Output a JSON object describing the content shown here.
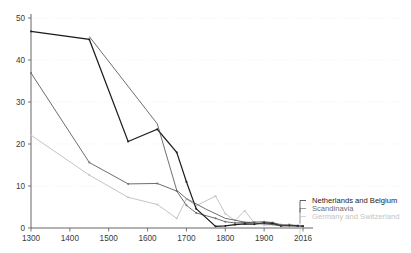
{
  "chart_data": {
    "type": "line",
    "title": "",
    "subtitle": "",
    "xlabel": "",
    "ylabel": "",
    "xlim": [
      1300,
      2016
    ],
    "ylim": [
      0,
      50
    ],
    "grid": true,
    "grid_style": "dotted horizontal",
    "legend_position": "right-inside",
    "x_ticks": [
      "1300",
      "1400",
      "1500",
      "1600",
      "1700",
      "1800",
      "1900",
      "2016"
    ],
    "x_tick_values": [
      1300,
      1400,
      1500,
      1600,
      1700,
      1800,
      1900,
      2016
    ],
    "y_ticks": [
      "0",
      "10",
      "20",
      "30",
      "40",
      "50"
    ],
    "y_tick_values": [
      0,
      10,
      20,
      30,
      40,
      50
    ],
    "series": [
      {
        "name": "Netherlands and Belgium",
        "color": "#1c1c1c",
        "width": 1.2,
        "x": [
          1300,
          1450,
          1550,
          1625,
          1675,
          1700,
          1725,
          1775,
          1800,
          1825,
          1850,
          1875,
          1900,
          1925,
          1950,
          1975,
          2000,
          2016
        ],
        "values": [
          46.8,
          44.9,
          20.6,
          23.5,
          18.0,
          11.0,
          4.6,
          0.4,
          0.5,
          0.8,
          1.0,
          0.9,
          1.2,
          1.1,
          0.5,
          0.6,
          0.5,
          0.4
        ]
      },
      {
        "name": "Scandinavia",
        "color": "#6e6e6e",
        "width": 1.0,
        "x": [
          1300,
          1450,
          1550,
          1625,
          1675,
          1700,
          1725,
          1775,
          1800,
          1825,
          1850,
          1875,
          1900,
          1925,
          1950,
          1975,
          2000,
          2016
        ],
        "values": [
          36.9,
          15.6,
          10.5,
          10.6,
          8.8,
          5.4,
          3.6,
          2.3,
          1.5,
          1.2,
          1.3,
          1.4,
          1.5,
          1.3,
          0.8,
          0.7,
          0.6,
          0.5
        ]
      },
      {
        "name": "Germany and Switzerland",
        "color": "#c4c4c4",
        "width": 1.0,
        "x": [
          1300,
          1450,
          1550,
          1625,
          1675,
          1700,
          1725,
          1775,
          1800,
          1825,
          1850,
          1875,
          1900,
          1925,
          1950,
          1975,
          2000,
          2016
        ],
        "values": [
          22.1,
          12.6,
          7.3,
          5.6,
          2.3,
          6.9,
          5.3,
          7.6,
          3.4,
          1.8,
          4.1,
          1.2,
          0.7,
          0.8,
          0.6,
          0.9,
          0.5,
          0.4
        ]
      }
    ],
    "extra_series": [
      {
        "name": "Netherlands and Belgium secondary",
        "color": "#4a4a4a",
        "width": 0.8,
        "x": [
          1450,
          1625,
          1675,
          1700,
          1750,
          1800,
          1850,
          1900,
          1950,
          2016
        ],
        "values": [
          45.6,
          24.8,
          9.0,
          7.0,
          4.5,
          2.3,
          1.4,
          1.0,
          0.6,
          0.4
        ]
      }
    ]
  },
  "legend": {
    "entries": [
      {
        "label": "Netherlands and Belgium",
        "color": "#1c1c1c"
      },
      {
        "label": "Scandinavia",
        "color": "#6e6e6e"
      },
      {
        "label": "Germany and Switzerland",
        "color": "#c4c4c4"
      }
    ]
  },
  "axes": {
    "y_tick_labels": [
      "50",
      "40",
      "30",
      "20",
      "10",
      "0"
    ],
    "x_tick_labels": [
      "1300",
      "1400",
      "1500",
      "1600",
      "1700",
      "1800",
      "1900",
      "2016"
    ]
  }
}
